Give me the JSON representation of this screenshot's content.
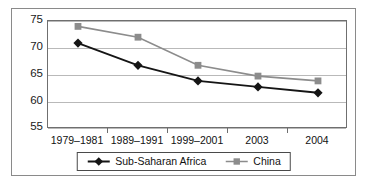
{
  "chart_data": {
    "type": "line",
    "title": "",
    "xlabel": "",
    "ylabel": "",
    "categories": [
      "1979–1981",
      "1989–1991",
      "1999–2001",
      "2003",
      "2004"
    ],
    "series": [
      {
        "name": "Sub-Saharan Africa",
        "color": "#151515",
        "marker": "diamond",
        "values": [
          70.9,
          66.8,
          63.9,
          62.8,
          61.7
        ]
      },
      {
        "name": "China",
        "color": "#8c8c8c",
        "marker": "square",
        "values": [
          74.0,
          72.0,
          66.8,
          64.8,
          63.9
        ]
      }
    ],
    "ylim": [
      55,
      75
    ],
    "yticks": [
      55,
      60,
      65,
      70,
      75
    ],
    "ytick_labels": [
      "55",
      "60",
      "65",
      "70",
      "75"
    ],
    "grid": true,
    "legend_position": "bottom-center"
  },
  "axis": {
    "y_labels": [
      "75",
      "70",
      "65",
      "60",
      "55"
    ],
    "x_labels": [
      "1979–1981",
      "1989–1991",
      "1999–2001",
      "2003",
      "2004"
    ]
  },
  "legend": {
    "entries": [
      {
        "label": "Sub-Saharan Africa"
      },
      {
        "label": "China"
      }
    ]
  },
  "colors": {
    "series_africa": "#151515",
    "series_china": "#8c8c8c",
    "gridline": "#b9b9b9",
    "frame": "#6f6f6f",
    "outer_border": "#8a8a8a"
  }
}
